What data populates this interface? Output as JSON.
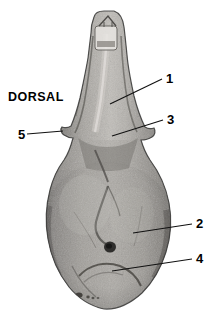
{
  "figure": {
    "name": "skull-dorsal-view",
    "view_label": "DORSAL",
    "background_color": "#ffffff",
    "specimen": {
      "description": "grayscale photograph of a mammal skull seen from above",
      "bone_light": "#d8d6d2",
      "bone_mid": "#9b9894",
      "bone_dark": "#5d5b58",
      "outline_color": "#3a3a38"
    },
    "leader_line_color": "#111111",
    "callouts": [
      {
        "id": "callout-1",
        "label": "1",
        "label_x": 166,
        "label_y": 72,
        "line": {
          "x1": 162,
          "y1": 79,
          "x2": 110,
          "y2": 104
        }
      },
      {
        "id": "callout-2",
        "label": "2",
        "label_x": 196,
        "label_y": 217,
        "line": {
          "x1": 192,
          "y1": 224,
          "x2": 133,
          "y2": 233
        }
      },
      {
        "id": "callout-3",
        "label": "3",
        "label_x": 167,
        "label_y": 113,
        "line": {
          "x1": 163,
          "y1": 120,
          "x2": 112,
          "y2": 136
        }
      },
      {
        "id": "callout-4",
        "label": "4",
        "label_x": 196,
        "label_y": 252,
        "line": {
          "x1": 192,
          "y1": 259,
          "x2": 112,
          "y2": 271
        }
      },
      {
        "id": "callout-5",
        "label": "5",
        "label_x": 18,
        "label_y": 128,
        "line": {
          "x1": 27,
          "y1": 134,
          "x2": 63,
          "y2": 131
        }
      }
    ],
    "orientation_label": {
      "text": "DORSAL",
      "x": 8,
      "y": 91
    }
  }
}
